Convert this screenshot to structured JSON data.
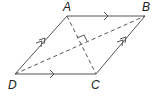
{
  "diagram": {
    "type": "rhombus",
    "colors": {
      "stroke": "#555555",
      "label": "#222222",
      "background": "#ffffff"
    },
    "vertices": [
      {
        "name": "A",
        "x": 67,
        "y": 16
      },
      {
        "name": "B",
        "x": 145,
        "y": 16
      },
      {
        "name": "C",
        "x": 96,
        "y": 74
      },
      {
        "name": "D",
        "x": 15,
        "y": 74
      }
    ],
    "labels": {
      "A": "A",
      "B": "B",
      "C": "C",
      "D": "D"
    },
    "sides": [
      {
        "from": "A",
        "to": "B",
        "style": "solid",
        "arrow_marks": 1
      },
      {
        "from": "D",
        "to": "C",
        "style": "solid",
        "arrow_marks": 1
      },
      {
        "from": "D",
        "to": "A",
        "style": "solid",
        "arrow_marks": 2
      },
      {
        "from": "C",
        "to": "B",
        "style": "solid",
        "arrow_marks": 2
      }
    ],
    "diagonals": [
      {
        "from": "A",
        "to": "C",
        "style": "dashed"
      },
      {
        "from": "D",
        "to": "B",
        "style": "dashed"
      }
    ],
    "annotations": [
      {
        "type": "right-angle",
        "at": "diagonal-intersection"
      }
    ]
  }
}
